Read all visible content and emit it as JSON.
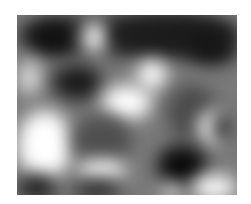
{
  "image": {
    "description": "Blurry grayscale texture with light and dark blobs",
    "frame": {
      "x": 17,
      "y": 15,
      "width": 220,
      "height": 180
    },
    "base_color": "#7a7a7a",
    "blobs": [
      {
        "x": 0,
        "y": 0,
        "w": 220,
        "h": 40,
        "c": "#2a2a2a"
      },
      {
        "x": 10,
        "y": 5,
        "w": 50,
        "h": 35,
        "c": "#111111"
      },
      {
        "x": 65,
        "y": 5,
        "w": 25,
        "h": 35,
        "c": "#f4f4f4"
      },
      {
        "x": 95,
        "y": 0,
        "w": 125,
        "h": 40,
        "c": "#1c1c1c"
      },
      {
        "x": 170,
        "y": 20,
        "w": 50,
        "h": 30,
        "c": "#141414"
      },
      {
        "x": 0,
        "y": 45,
        "w": 25,
        "h": 35,
        "c": "#d8d8d8"
      },
      {
        "x": 35,
        "y": 50,
        "w": 50,
        "h": 35,
        "c": "#1a1a1a"
      },
      {
        "x": 120,
        "y": 45,
        "w": 30,
        "h": 30,
        "c": "#ffffff"
      },
      {
        "x": 85,
        "y": 70,
        "w": 50,
        "h": 35,
        "c": "#ffffff"
      },
      {
        "x": 150,
        "y": 70,
        "w": 50,
        "h": 55,
        "c": "#4a4a4a"
      },
      {
        "x": 0,
        "y": 95,
        "w": 55,
        "h": 70,
        "c": "#ffffff"
      },
      {
        "x": 55,
        "y": 100,
        "w": 60,
        "h": 50,
        "c": "#4f4f4f"
      },
      {
        "x": 180,
        "y": 95,
        "w": 35,
        "h": 35,
        "c": "#efefef"
      },
      {
        "x": 195,
        "y": 95,
        "w": 25,
        "h": 35,
        "c": "#3a3a3a"
      },
      {
        "x": 140,
        "y": 130,
        "w": 50,
        "h": 40,
        "c": "#0a0a0a"
      },
      {
        "x": 60,
        "y": 145,
        "w": 50,
        "h": 20,
        "c": "#ffffff"
      },
      {
        "x": 0,
        "y": 160,
        "w": 40,
        "h": 25,
        "c": "#1e1e1e"
      },
      {
        "x": 55,
        "y": 165,
        "w": 50,
        "h": 20,
        "c": "#2a2a2a"
      },
      {
        "x": 175,
        "y": 160,
        "w": 45,
        "h": 25,
        "c": "#ffffff"
      },
      {
        "x": 145,
        "y": 170,
        "w": 20,
        "h": 15,
        "c": "#ededed"
      }
    ]
  }
}
